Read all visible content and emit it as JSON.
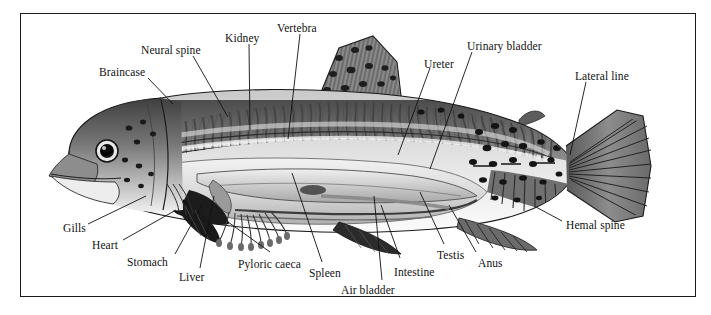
{
  "figure": {
    "credit": "GODKIN",
    "frame_color": "#1a1a1a",
    "background_color": "#ffffff",
    "ink_color": "#111111"
  },
  "labels": [
    {
      "id": "braincase",
      "text": "Braincase",
      "x": 99,
      "y": 66,
      "leader": [
        [
          148,
          78
        ],
        [
          173,
          104
        ]
      ]
    },
    {
      "id": "neural-spine",
      "text": "Neural spine",
      "x": 141,
      "y": 44,
      "leader": [
        [
          193,
          56
        ],
        [
          228,
          117
        ]
      ]
    },
    {
      "id": "kidney",
      "text": "Kidney",
      "x": 225,
      "y": 32,
      "leader": [
        [
          249,
          44
        ],
        [
          250,
          130
        ]
      ]
    },
    {
      "id": "vertebra",
      "text": "Vertebra",
      "x": 277,
      "y": 22,
      "leader": [
        [
          300,
          34
        ],
        [
          288,
          139
        ]
      ]
    },
    {
      "id": "ureter",
      "text": "Ureter",
      "x": 424,
      "y": 58,
      "leader": [
        [
          430,
          68
        ],
        [
          398,
          155
        ]
      ]
    },
    {
      "id": "urinary-bladder",
      "text": "Urinary bladder",
      "x": 467,
      "y": 40,
      "leader": [
        [
          472,
          52
        ],
        [
          430,
          169
        ]
      ]
    },
    {
      "id": "lateral-line",
      "text": "Lateral line",
      "x": 575,
      "y": 70,
      "leader": [
        [
          586,
          82
        ],
        [
          570,
          155
        ]
      ]
    },
    {
      "id": "gills",
      "text": "Gills",
      "x": 63,
      "y": 222,
      "leader": [
        [
          88,
          224
        ],
        [
          146,
          196
        ]
      ]
    },
    {
      "id": "heart",
      "text": "Heart",
      "x": 92,
      "y": 239,
      "leader": [
        [
          123,
          240
        ],
        [
          176,
          210
        ]
      ]
    },
    {
      "id": "stomach",
      "text": "Stomach",
      "x": 127,
      "y": 256,
      "leader": [
        [
          175,
          254
        ],
        [
          202,
          205
        ]
      ]
    },
    {
      "id": "liver",
      "text": "Liver",
      "x": 179,
      "y": 271,
      "leader": [
        [
          200,
          268
        ],
        [
          214,
          196
        ]
      ]
    },
    {
      "id": "pyloric-caeca",
      "text": "Pyloric caeca",
      "x": 238,
      "y": 258,
      "leader": [
        [
          270,
          252
        ],
        [
          228,
          222
        ]
      ]
    },
    {
      "id": "spleen",
      "text": "Spleen",
      "x": 309,
      "y": 267,
      "leader": [
        [
          322,
          262
        ],
        [
          292,
          173
        ]
      ]
    },
    {
      "id": "air-bladder",
      "text": "Air bladder",
      "x": 341,
      "y": 284,
      "leader": [
        [
          382,
          280
        ],
        [
          374,
          196
        ]
      ]
    },
    {
      "id": "intestine",
      "text": "Intestine",
      "x": 394,
      "y": 266,
      "leader": [
        [
          400,
          258
        ],
        [
          381,
          205
        ]
      ]
    },
    {
      "id": "testis",
      "text": "Testis",
      "x": 437,
      "y": 249,
      "leader": [
        [
          444,
          244
        ],
        [
          420,
          192
        ]
      ]
    },
    {
      "id": "anus",
      "text": "Anus",
      "x": 478,
      "y": 257,
      "leader": [
        [
          476,
          252
        ],
        [
          449,
          205
        ]
      ]
    },
    {
      "id": "hemal-spine",
      "text": "Hemal spine",
      "x": 566,
      "y": 219,
      "leader": [
        [
          562,
          221
        ],
        [
          536,
          207
        ]
      ]
    }
  ]
}
